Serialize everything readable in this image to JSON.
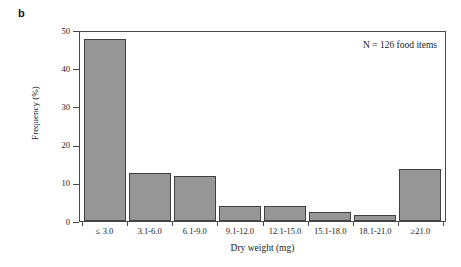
{
  "figure": {
    "panel_label": "b"
  },
  "chart_data": {
    "type": "bar",
    "title": "",
    "xlabel": "Dry weight (mg)",
    "ylabel": "Frequency (%)",
    "categories": [
      "≤ 3.0",
      "3.1-6.0",
      "6.1-9.0",
      "9.1-12.0",
      "12.1-15.0",
      "15.1-18.0",
      "18.1-21.0",
      "≥21.0"
    ],
    "values": [
      47.6,
      12.7,
      11.9,
      4.0,
      4.0,
      2.4,
      1.6,
      13.5
    ],
    "ylim": [
      0,
      50
    ],
    "yticks": [
      0,
      10,
      20,
      30,
      40,
      50
    ],
    "ytick_labels": [
      "0",
      "10",
      "20",
      "30",
      "40",
      "50"
    ],
    "grid": false,
    "legend": null,
    "annotations": [
      {
        "name": "sample-size",
        "text": "N = 126 food items",
        "position": "top-right"
      }
    ],
    "bar_fill_color": "#969696",
    "bar_edge_color": "#404040",
    "axis_color": "#4a4a4a",
    "background_color": "#ffffff"
  }
}
